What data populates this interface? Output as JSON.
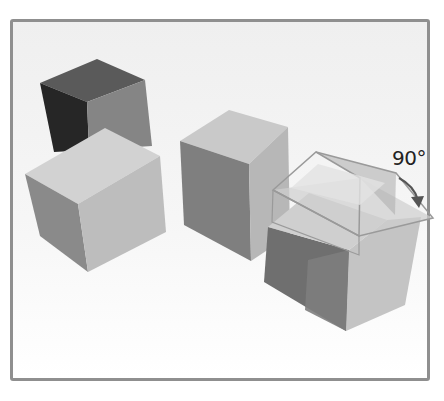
{
  "figure": {
    "rotation_label": "90°",
    "colors": {
      "frame_border": "#8f8f8f",
      "background": "#f3f3f3",
      "dark_face": "#2e2e2e",
      "mid_face": "#7a7a7a",
      "light_face": "#c8c8c8",
      "lighter_face": "#d8d8d8",
      "arrow": "#555555"
    }
  }
}
